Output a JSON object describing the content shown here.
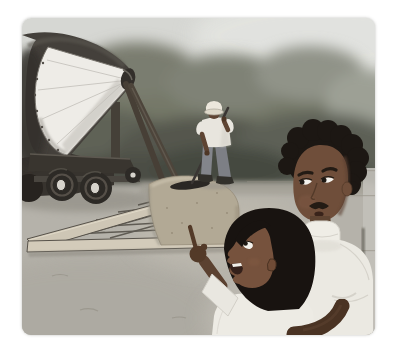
{
  "illustration": {
    "alt": "Storybook illustration: a sidewalk is paved with fresh concrete while a child, held by a man, points at the work",
    "scene": {
      "setting": "outdoor work site with dark leafy trees behind and bare gray ground",
      "action": "An old-fashioned cement mixer on wheels pours wet concrete into a wooden sidewalk form lined with rebar mesh; a worker in a hard hat levels the concrete with a long-handled screed while a smiling child, held by a mustached man in a white shirt, points up at the pour.",
      "figures": [
        {
          "name": "construction-worker",
          "detail": "hard hat, white shirt, gray pants, dark boots, levels wet concrete with a screed"
        },
        {
          "name": "father",
          "detail": "man with short curly black hair and mustache, white collared shirt, looks down while holding the child"
        },
        {
          "name": "child",
          "detail": "boy with black bowl-cut hair, white shirt, mouth open, pointing with raised fist and extended finger"
        }
      ],
      "objects": [
        "cement-mixer",
        "mixer-cone-opening",
        "mixer-wheels",
        "wet-concrete",
        "wooden-form-boards",
        "rebar-mesh",
        "screed-tool",
        "tree-line",
        "wall-post"
      ]
    }
  },
  "palette": {
    "page_bg": "#ffffff",
    "sky": "#d6d7d3",
    "sky_light": "#e3e4e0",
    "tree_base": "#757868",
    "ground": "#b5b2aa",
    "slab_band": "#a29f94",
    "wall_strip": "#c2c0b9",
    "wall_line": "#57534c",
    "drum": "#44403b",
    "drum_bed": "#37332e",
    "cone": "#eeece7",
    "chassis": "#39352f",
    "tire": "#2d2a26",
    "hub": "#d6d3cc",
    "strut": "#473f36",
    "wood_side": "#cec6b5",
    "wood_front": "#d3cbba",
    "mesh": "#56524a",
    "concrete": "#b2a995",
    "blade": "#2a2724",
    "handle": "#3a3633",
    "hat": "#ece7dc",
    "worker_shirt": "#e8e5de",
    "pants": "#83858b",
    "boots": "#32302b",
    "worker_skin": "#5e4433",
    "man_skin": "#6f4e3a",
    "child_skin": "#76523d",
    "fist_skin": "#533a28",
    "man_forearm": "#4a3323",
    "man_hair": "#1c1713",
    "child_hair": "#181310",
    "man_shirt": "#ebe9e2",
    "child_shirt": "#edebe4",
    "collar": "#efede6",
    "eye_white": "#f3f1ec",
    "pupil": "#1d1813",
    "mustache": "#231b14",
    "mouth": "#39231a",
    "child_mouth": "#34201a",
    "teeth": "#f0eee8"
  }
}
